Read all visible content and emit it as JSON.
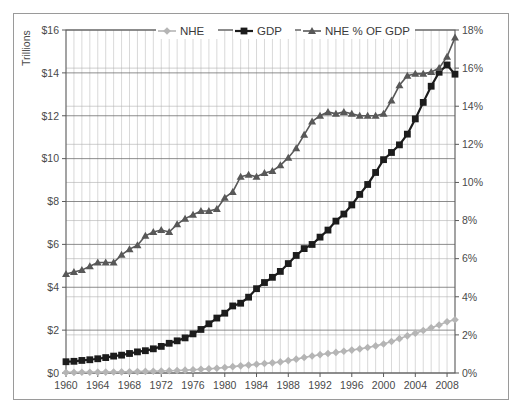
{
  "chart_data": {
    "type": "line",
    "title": "",
    "xlabel": "",
    "ylabel": "Trillions",
    "y2label": "",
    "xlim": [
      1960,
      2009
    ],
    "ylim": [
      0,
      16
    ],
    "y2lim": [
      0,
      18
    ],
    "grid": true,
    "legend_position": "top-center",
    "x": [
      1960,
      1961,
      1962,
      1963,
      1964,
      1965,
      1966,
      1967,
      1968,
      1969,
      1970,
      1971,
      1972,
      1973,
      1974,
      1975,
      1976,
      1977,
      1978,
      1979,
      1980,
      1981,
      1982,
      1983,
      1984,
      1985,
      1986,
      1987,
      1988,
      1989,
      1990,
      1991,
      1992,
      1993,
      1994,
      1995,
      1996,
      1997,
      1998,
      1999,
      2000,
      2001,
      2002,
      2003,
      2004,
      2005,
      2006,
      2007,
      2008,
      2009
    ],
    "xticks": [
      1960,
      1964,
      1968,
      1972,
      1976,
      1980,
      1984,
      1988,
      1992,
      1996,
      2000,
      2004,
      2008
    ],
    "xticklabels": [
      "1960",
      "1964",
      "1968",
      "1972",
      "1976",
      "1980",
      "1984",
      "1988",
      "1992",
      "1996",
      "2000",
      "2004",
      "2008"
    ],
    "yticks": [
      0,
      2,
      4,
      6,
      8,
      10,
      12,
      14,
      16
    ],
    "yticklabels": [
      "$0",
      "$2",
      "$4",
      "$6",
      "$8",
      "$10",
      "$12",
      "$14",
      "$16"
    ],
    "y2ticks": [
      0,
      2,
      4,
      6,
      8,
      10,
      12,
      14,
      16,
      18
    ],
    "y2ticklabels": [
      "0%",
      "2%",
      "4%",
      "6%",
      "8%",
      "10%",
      "12%",
      "14%",
      "16%",
      "18%"
    ],
    "series": [
      {
        "name": "NHE",
        "axis": "left",
        "marker": "diamond",
        "color": "#b5b5b5",
        "values": [
          0.027,
          0.029,
          0.032,
          0.035,
          0.039,
          0.042,
          0.046,
          0.052,
          0.059,
          0.066,
          0.075,
          0.083,
          0.093,
          0.103,
          0.117,
          0.133,
          0.152,
          0.172,
          0.194,
          0.221,
          0.256,
          0.296,
          0.334,
          0.369,
          0.406,
          0.441,
          0.474,
          0.517,
          0.579,
          0.647,
          0.724,
          0.791,
          0.855,
          0.913,
          0.962,
          1.017,
          1.069,
          1.125,
          1.191,
          1.265,
          1.353,
          1.47,
          1.603,
          1.733,
          1.855,
          1.982,
          2.113,
          2.24,
          2.391,
          2.486
        ]
      },
      {
        "name": "GDP",
        "axis": "left",
        "marker": "square",
        "color": "#1c1c1c",
        "values": [
          0.526,
          0.545,
          0.586,
          0.618,
          0.664,
          0.719,
          0.788,
          0.833,
          0.91,
          0.985,
          1.04,
          1.128,
          1.241,
          1.386,
          1.501,
          1.638,
          1.825,
          2.031,
          2.295,
          2.563,
          2.79,
          3.128,
          3.255,
          3.537,
          3.933,
          4.22,
          4.463,
          4.739,
          5.104,
          5.484,
          5.803,
          5.996,
          6.338,
          6.667,
          7.085,
          7.415,
          7.839,
          8.332,
          8.794,
          9.354,
          9.952,
          10.286,
          10.642,
          11.142,
          11.853,
          12.623,
          13.377,
          14.029,
          14.369,
          13.939
        ]
      },
      {
        "name": "NHE % OF GDP",
        "axis": "right",
        "marker": "triangle",
        "color": "#585858",
        "values": [
          5.2,
          5.3,
          5.4,
          5.6,
          5.8,
          5.8,
          5.8,
          6.2,
          6.5,
          6.7,
          7.2,
          7.4,
          7.5,
          7.4,
          7.8,
          8.1,
          8.3,
          8.5,
          8.5,
          8.6,
          9.2,
          9.5,
          10.3,
          10.4,
          10.3,
          10.5,
          10.6,
          10.9,
          11.3,
          11.8,
          12.5,
          13.2,
          13.5,
          13.7,
          13.6,
          13.7,
          13.6,
          13.5,
          13.5,
          13.5,
          13.6,
          14.3,
          15.1,
          15.6,
          15.7,
          15.7,
          15.8,
          16.0,
          16.6,
          17.6
        ]
      }
    ],
    "legend": [
      {
        "label": "NHE",
        "marker": "diamond",
        "color": "#b5b5b5"
      },
      {
        "label": "GDP",
        "marker": "square",
        "color": "#1c1c1c"
      },
      {
        "label": "NHE % OF GDP",
        "marker": "triangle",
        "color": "#585858"
      }
    ]
  },
  "axes": {
    "left_title": "Trillions"
  }
}
